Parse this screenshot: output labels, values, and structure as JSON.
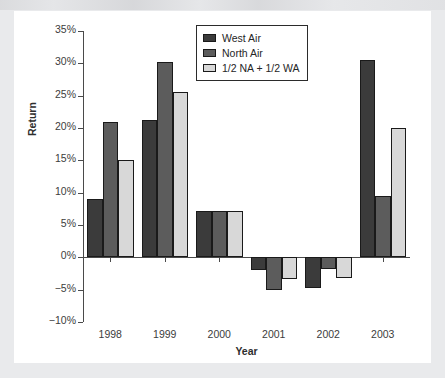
{
  "chart_data": {
    "type": "bar",
    "title": "",
    "xlabel": "Year",
    "ylabel": "Return",
    "categories": [
      "1998",
      "1999",
      "2000",
      "2001",
      "2002",
      "2003"
    ],
    "series": [
      {
        "name": "West Air",
        "color": "#3b3b3b",
        "values": [
          9.0,
          21.2,
          7.2,
          -2.0,
          -4.8,
          30.5
        ]
      },
      {
        "name": "North Air",
        "color": "#5c5c5c",
        "values": [
          21.0,
          30.2,
          7.2,
          -5.0,
          -1.8,
          9.5
        ]
      },
      {
        "name": "1/2 NA + 1/2 WA",
        "color": "#d8d8d8",
        "values": [
          15.0,
          25.6,
          7.2,
          -3.3,
          -3.2,
          20.0
        ]
      }
    ],
    "ylim": [
      -10,
      35
    ],
    "ytick_values": [
      35,
      30,
      25,
      20,
      15,
      10,
      5,
      0,
      -5,
      -10
    ],
    "ytick_labels": [
      "35%",
      "30%",
      "25%",
      "20%",
      "15%",
      "10%",
      "5%",
      "0%",
      "−5%",
      "−10%"
    ],
    "grid": false,
    "legend_position": "top-center",
    "value_unit": "%"
  },
  "legend": {
    "items": [
      {
        "label": "West Air"
      },
      {
        "label": "North Air"
      },
      {
        "label": "1/2 NA + 1/2 WA"
      }
    ]
  },
  "axes": {
    "x_title": "Year",
    "y_title": "Return"
  }
}
